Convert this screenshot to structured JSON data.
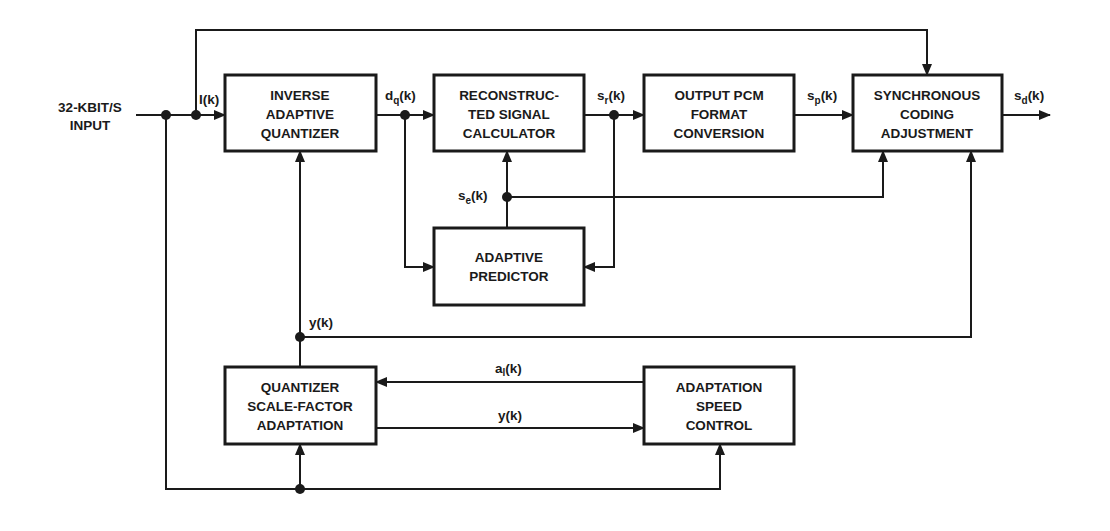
{
  "diagram": {
    "input_label": [
      "32-KBIT/S",
      "INPUT"
    ],
    "blocks": {
      "inverse_quantizer": [
        "INVERSE",
        "ADAPTIVE",
        "QUANTIZER"
      ],
      "reconstructed_signal": [
        "RECONSTRUC-",
        "TED SIGNAL",
        "CALCULATOR"
      ],
      "output_pcm": [
        "OUTPUT PCM",
        "FORMAT",
        "CONVERSION"
      ],
      "synchronous_coding": [
        "SYNCHRONOUS",
        "CODING",
        "ADJUSTMENT"
      ],
      "adaptive_predictor": [
        "ADAPTIVE",
        "PREDICTOR"
      ],
      "scale_factor": [
        "QUANTIZER",
        "SCALE-FACTOR",
        "ADAPTATION"
      ],
      "speed_control": [
        "ADAPTATION",
        "SPEED",
        "CONTROL"
      ]
    },
    "signals": {
      "I": {
        "base": "I",
        "sub": "",
        "arg": "(k)"
      },
      "dq": {
        "base": "d",
        "sub": "q",
        "arg": "(k)"
      },
      "sr": {
        "base": "s",
        "sub": "r",
        "arg": "(k)"
      },
      "sp": {
        "base": "s",
        "sub": "p",
        "arg": "(k)"
      },
      "sd": {
        "base": "s",
        "sub": "d",
        "arg": "(k)"
      },
      "se": {
        "base": "s",
        "sub": "e",
        "arg": "(k)"
      },
      "y_mid": {
        "base": "y",
        "sub": "",
        "arg": "(k)"
      },
      "al": {
        "base": "a",
        "sub": "l",
        "arg": "(k)"
      },
      "y_low": {
        "base": "y",
        "sub": "",
        "arg": "(k)"
      }
    }
  }
}
